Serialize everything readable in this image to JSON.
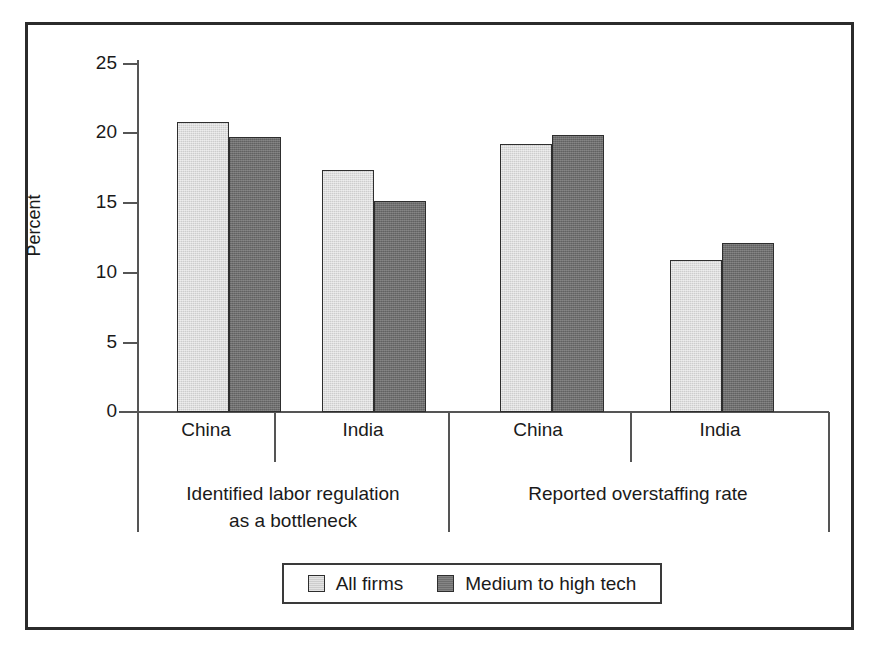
{
  "chart_data": {
    "type": "bar",
    "title": "",
    "xlabel": "",
    "ylabel": "Percent",
    "ylim": [
      0,
      25
    ],
    "yticks": [
      0,
      5,
      10,
      15,
      20,
      25
    ],
    "ytick_labels": [
      "0",
      "5",
      "10",
      "15",
      "20",
      "25"
    ],
    "grid": false,
    "legend_position": "bottom-center",
    "categories": [
      "China",
      "India",
      "China",
      "India"
    ],
    "groups": [
      {
        "label_line1": "Identified labor regulation",
        "label_line2": "as a bottleneck",
        "label": "Identified labor regulation as a bottleneck",
        "categories": [
          "China",
          "India"
        ]
      },
      {
        "label_line1": "Reported overstaffing rate",
        "label_line2": "",
        "label": "Reported overstaffing rate",
        "categories": [
          "China",
          "India"
        ]
      }
    ],
    "series": [
      {
        "name": "All firms",
        "color": "#cdcdcd",
        "values": [
          20.6,
          17.2,
          19.0,
          10.8
        ]
      },
      {
        "name": "Medium to high tech",
        "color": "#6e6e6e",
        "values": [
          19.5,
          15.0,
          19.7,
          12.0
        ]
      }
    ]
  },
  "axis": {
    "ylabel": "Percent",
    "ticks": [
      {
        "value": "25"
      },
      {
        "value": "20"
      },
      {
        "value": "15"
      },
      {
        "value": "10"
      },
      {
        "value": "5"
      },
      {
        "value": "0"
      }
    ]
  },
  "category_labels": [
    {
      "text": "China"
    },
    {
      "text": "India"
    },
    {
      "text": "China"
    },
    {
      "text": "India"
    }
  ],
  "group_labels": [
    {
      "line1": "Identified labor regulation",
      "line2": "as a bottleneck"
    },
    {
      "line1": "Reported overstaffing rate",
      "line2": ""
    }
  ],
  "legend": {
    "entries": [
      {
        "label": "All firms",
        "swatch": "light-gray-square"
      },
      {
        "label": "Medium to high tech",
        "swatch": "dark-gray-square"
      }
    ]
  },
  "colors": {
    "all_firms": "#cdcdcd",
    "medium_high_tech": "#6e6e6e",
    "frame": "#2b2b2b",
    "axis": "#555555",
    "text": "#1a1a1a"
  }
}
